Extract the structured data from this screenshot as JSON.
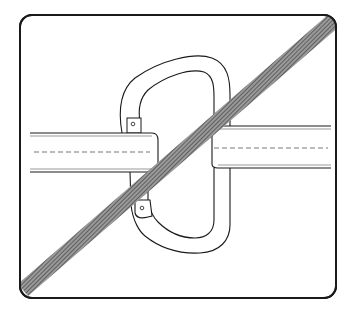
{
  "figure": {
    "title": "Carabiner clipped across strap gap - prohibited",
    "caption": "",
    "colors": {
      "line": "#1a1a1a",
      "background": "#ffffff",
      "slash": "#6e6e6e"
    },
    "elements": {
      "frame": "rounded-rectangle-frame",
      "strap_left": "left-webbing-strap",
      "strap_right": "right-webbing-strap",
      "carabiner": "carabiner",
      "slash": "prohibition-slash"
    }
  }
}
